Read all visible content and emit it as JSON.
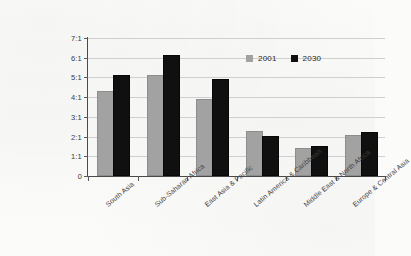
{
  "chart_data": {
    "type": "bar",
    "title": "",
    "subtitle": "",
    "xlabel": "",
    "ylabel": "",
    "categories": [
      "South Asia",
      "Sub-Saharan Africa",
      "East Asia & Pacific",
      "Latin America & Caribbean",
      "Middle East & North Africa",
      "Europe & Central Asia"
    ],
    "series": [
      {
        "name": "2001",
        "color": "#a2a2a2",
        "values": [
          4.2,
          5.0,
          3.8,
          2.2,
          1.3,
          2.0
        ]
      },
      {
        "name": "2030",
        "color": "#101010",
        "values": [
          5.0,
          6.05,
          4.8,
          1.95,
          1.4,
          2.15
        ]
      }
    ],
    "ylim": [
      0,
      7
    ],
    "ytick_values": [
      0,
      1,
      2,
      3,
      4,
      5,
      6,
      7
    ],
    "ytick_labels": [
      "0",
      "1:1",
      "2:1",
      "3:1",
      "4:1",
      "5:1",
      "6:1",
      "7:1"
    ],
    "grid": true,
    "legend_position": "top-right",
    "legend_entries": [
      "2001",
      "2030"
    ]
  }
}
